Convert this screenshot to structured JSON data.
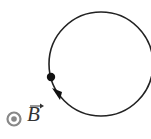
{
  "diagram": {
    "field_symbol": "⊙",
    "field_label": "B",
    "field_vector_arrow": "→",
    "field_direction": "out-of-page",
    "circle": {
      "cx": 101,
      "cy": 64,
      "r": 52,
      "stroke": "#222222"
    },
    "particle": {
      "cx": 52,
      "cy": 77,
      "r": 4,
      "fill": "#111111"
    },
    "motion_direction": "counterclockwise-down",
    "colors": {
      "field_symbol": "#888888",
      "line": "#222222"
    }
  }
}
